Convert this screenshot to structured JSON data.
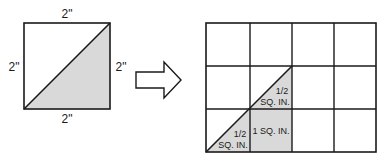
{
  "colors": {
    "shade": "#d9d9d9",
    "line": "#1a1a1a",
    "background": "#ffffff"
  },
  "left_square": {
    "top_label": "2\"",
    "left_label": "2\"",
    "right_label": "2\"",
    "bottom_label": "2\""
  },
  "arrow": {
    "icon": "right-arrow-icon"
  },
  "grid": {
    "columns": 4,
    "rows": 3,
    "upper_triangle_fraction": "1/2",
    "upper_triangle_unit": "SQ. IN.",
    "lower_triangle_fraction": "1/2",
    "lower_triangle_unit": "SQ. IN.",
    "full_square_label": "1 SQ. IN."
  }
}
